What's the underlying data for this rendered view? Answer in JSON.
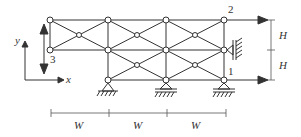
{
  "diagram": {
    "type": "truss structure with supports and applied loads",
    "node_labels": {
      "n1": "1",
      "n2": "2",
      "n3": "3"
    },
    "axes": {
      "x": "x",
      "y": "y"
    },
    "dimensions": {
      "horizontal": [
        "W",
        "W",
        "W"
      ],
      "vertical": [
        "H",
        "H"
      ]
    },
    "loads": [
      "horizontal arrow at node 2",
      "horizontal arrow at node 1",
      "vertical double arrow at node 3"
    ],
    "supports": [
      "pin support bottom-left",
      "roller support bottom-middle",
      "roller support bottom-right",
      "roller wall support at right-middle node"
    ],
    "colors": {
      "line": "#333333",
      "node_fill": "#ffffff"
    }
  }
}
